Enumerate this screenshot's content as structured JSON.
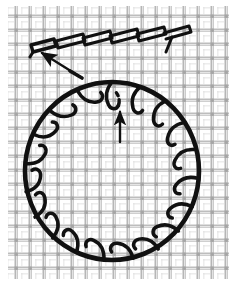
{
  "figure": {
    "caption": "",
    "background": {
      "name": "canvas-mesh-grid",
      "fabric_color": "#ffffff",
      "thread_color": "#b2b2b2",
      "thread_color_dark": "#9a9a9a",
      "cell_size": 14,
      "thread_width": 3,
      "margin_left": 8,
      "margin_right": 8,
      "margin_top": 6,
      "margin_bottom": 6
    },
    "ink_color": "#111111",
    "elements": [
      {
        "id": "stitch-row",
        "name": "straight-row-of-stitches",
        "label": "row of slanted looped stitches",
        "count": 6,
        "start_x": 34,
        "start_y": 48,
        "step_x": 27,
        "step_y": -3,
        "loop_width": 24,
        "loop_height": 9,
        "direction": "left-to-right, rising"
      },
      {
        "id": "row-arrow",
        "name": "pointer-arrow-to-first-stitch",
        "label": "arrow indicating first stitch of the row",
        "from_x": 80,
        "from_y": 76,
        "to_x": 40,
        "to_y": 52,
        "style": "solid-shaft-filled-head"
      },
      {
        "id": "stitch-circle",
        "name": "circular-ring-of-stitches",
        "label": "blanket stitch worked around a circle",
        "center_x": 112,
        "center_y": 171,
        "radius_x": 87,
        "radius_y": 89,
        "stitch_count": 19,
        "hook_length": 22,
        "direction": "clockwise"
      },
      {
        "id": "circle-arrow",
        "name": "pointer-arrow-to-circle-stitch",
        "label": "vertical arrow indicating a single stitch loop on the circle",
        "from_x": 120,
        "from_y": 140,
        "to_x": 120,
        "to_y": 110,
        "style": "solid-shaft-filled-head"
      }
    ]
  },
  "colors": {
    "ink": "#111111",
    "mesh_light": "#bcbcbc",
    "mesh_mid": "#a8a8a8",
    "mesh_dark": "#909090",
    "paper": "#ffffff"
  }
}
